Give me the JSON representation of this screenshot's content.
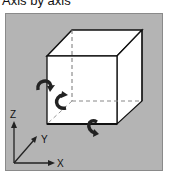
{
  "title": "Axis by axis",
  "axes": {
    "z_label": "Z",
    "y_label": "Y",
    "x_label": "X"
  },
  "colors": {
    "panel": "#b4b4b4",
    "cube_face": "#ffffff",
    "edge": "#111111",
    "hidden_edge": "#888888"
  },
  "icons": [
    "rotate-x-icon",
    "rotate-y-icon",
    "rotate-z-icon"
  ]
}
